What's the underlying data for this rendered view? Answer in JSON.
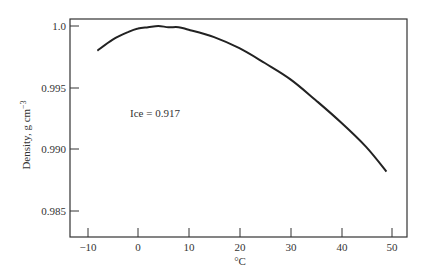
{
  "chart_data": {
    "type": "line",
    "title": "",
    "xlabel": "°C",
    "ylabel": "Density, g cm⁻³",
    "xlim": [
      -13,
      53
    ],
    "ylim": [
      0.9829,
      1.0008
    ],
    "grid": false,
    "legend": null,
    "x_ticks": [
      -10,
      0,
      10,
      20,
      30,
      40,
      50
    ],
    "x_tick_labels": [
      "−10",
      "0",
      "10",
      "20",
      "30",
      "40",
      "50"
    ],
    "y_ticks": [
      1.0,
      0.995,
      0.99,
      0.985
    ],
    "y_tick_labels": [
      "1.0",
      "0.995",
      "0.990",
      "0.985"
    ],
    "annotations": [
      {
        "text": "Ice = 0.917",
        "x": 7,
        "y": 0.9935
      }
    ],
    "series": [
      {
        "name": "Water density",
        "x": [
          -8,
          -5,
          -2,
          0,
          2,
          4,
          6,
          8,
          10,
          15,
          20,
          25,
          30,
          35,
          40,
          45,
          49
        ],
        "values": [
          0.998,
          0.9989,
          0.9995,
          0.9998,
          0.9999,
          1.0,
          0.9999,
          0.9999,
          0.9997,
          0.9991,
          0.9982,
          0.997,
          0.9957,
          0.994,
          0.9922,
          0.9902,
          0.9882
        ]
      }
    ]
  },
  "labels": {
    "ylabel_main": "Density, g cm",
    "ylabel_sup": "−3",
    "xlabel": "°C",
    "annotation": "Ice = 0.917",
    "y_ticks": [
      "1.0",
      "0.995",
      "0.990",
      "0.985"
    ],
    "x_ticks": [
      "−10",
      "0",
      "10",
      "20",
      "30",
      "40",
      "50"
    ]
  }
}
